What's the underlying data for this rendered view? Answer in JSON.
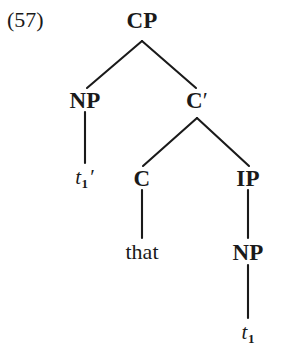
{
  "figure": {
    "example_number": "(57)",
    "kind": "syntax-tree",
    "background_color": "#ffffff",
    "ink_color": "#1a1a1a"
  },
  "tree": {
    "nodes": [
      {
        "id": "cp",
        "label": "CP",
        "x": 142,
        "y": 20,
        "style": "node-label"
      },
      {
        "id": "np-spec",
        "label": "NP",
        "x": 85,
        "y": 100,
        "style": "node-label"
      },
      {
        "id": "cbar",
        "label": "C",
        "prime": "′",
        "x": 197,
        "y": 100,
        "style": "node-label"
      },
      {
        "id": "trace1",
        "label": "t",
        "sub": "1",
        "prime": "′",
        "x": 85,
        "y": 178,
        "style": "trace"
      },
      {
        "id": "c",
        "label": "C",
        "x": 142,
        "y": 178,
        "style": "node-label"
      },
      {
        "id": "ip",
        "label": "IP",
        "x": 248,
        "y": 178,
        "style": "node-label"
      },
      {
        "id": "that",
        "label": "that",
        "x": 142,
        "y": 252,
        "style": "terminal"
      },
      {
        "id": "np-comp",
        "label": "NP",
        "x": 248,
        "y": 252,
        "style": "node-label"
      },
      {
        "id": "trace2",
        "label": "t",
        "sub": "1",
        "x": 248,
        "y": 333,
        "style": "trace"
      }
    ],
    "edges": [
      {
        "id": "cp-np",
        "from": "cp",
        "to": "np-spec",
        "x1": 142,
        "y1": 41,
        "x2": 87,
        "y2": 88
      },
      {
        "id": "cp-cbar",
        "from": "cp",
        "to": "cbar",
        "x1": 142,
        "y1": 41,
        "x2": 196,
        "y2": 88
      },
      {
        "id": "np-trace1",
        "from": "np-spec",
        "to": "trace1",
        "x1": 85,
        "y1": 112,
        "x2": 85,
        "y2": 163
      },
      {
        "id": "cbar-c",
        "from": "cbar",
        "to": "c",
        "x1": 197,
        "y1": 118,
        "x2": 143,
        "y2": 166
      },
      {
        "id": "cbar-ip",
        "from": "cbar",
        "to": "ip",
        "x1": 197,
        "y1": 118,
        "x2": 249,
        "y2": 166
      },
      {
        "id": "c-that",
        "from": "c",
        "to": "that",
        "x1": 142,
        "y1": 190,
        "x2": 142,
        "y2": 238
      },
      {
        "id": "ip-np",
        "from": "ip",
        "to": "np-comp",
        "x1": 248,
        "y1": 190,
        "x2": 248,
        "y2": 238
      },
      {
        "id": "np-trace2",
        "from": "np-comp",
        "to": "trace2",
        "x1": 248,
        "y1": 265,
        "x2": 248,
        "y2": 318
      }
    ]
  }
}
